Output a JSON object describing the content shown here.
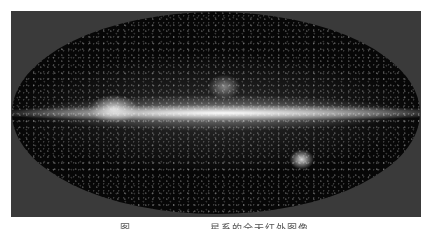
{
  "figure": {
    "image_description": "Milky Way all-sky infrared map (elliptical projection) with bright galactic plane band",
    "caption_prefix": "图",
    "caption_text": "星系的全天红外图像"
  }
}
